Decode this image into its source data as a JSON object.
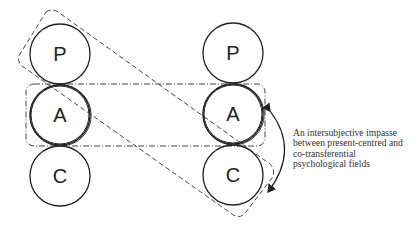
{
  "diagram": {
    "left_column": {
      "labels": [
        "P",
        "A",
        "C"
      ]
    },
    "right_column": {
      "labels": [
        "P",
        "A",
        "C"
      ]
    },
    "caption_lines": [
      "An intersubjective impasse",
      "between present-centred and",
      "co-transferential",
      "psychological fields"
    ],
    "colors": {
      "stroke": "#222222",
      "dash": "#444444",
      "background": "#ffffff"
    }
  }
}
